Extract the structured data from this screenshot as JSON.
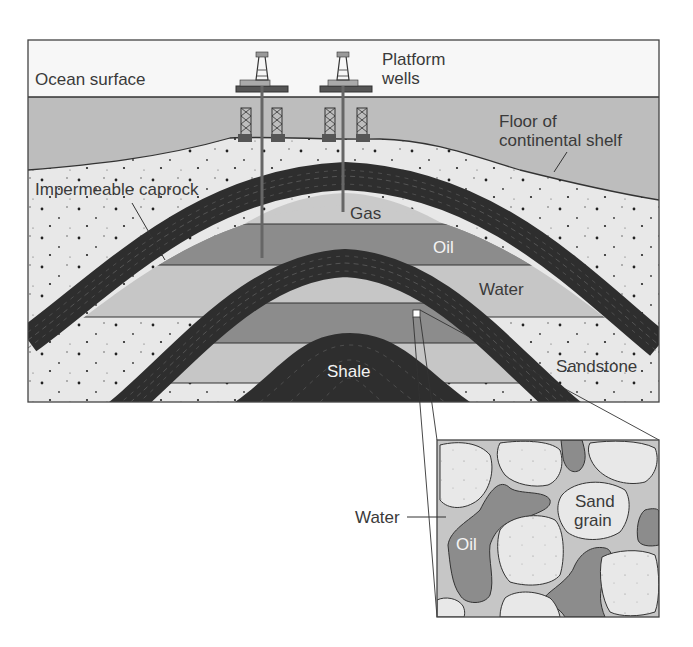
{
  "diagram": {
    "type": "geologic cross-section of offshore oil and gas trap",
    "labels": {
      "ocean_surface": "Ocean surface",
      "platform_wells_line1": "Platform",
      "platform_wells_line2": "wells",
      "floor_line1": "Floor of",
      "floor_line2": "continental shelf",
      "caprock": "Impermeable caprock",
      "gas": "Gas",
      "oil": "Oil",
      "water": "Water",
      "sandstone": "Sandstone",
      "shale": "Shale"
    },
    "inset": {
      "water": "Water",
      "oil": "Oil",
      "sand_grain_line1": "Sand",
      "sand_grain_line2": "grain"
    },
    "colors": {
      "sky": "#f7f7f7",
      "ocean": "#bdbdbd",
      "sediment": "#e8e8e8",
      "caprock": "#2e2e2e",
      "gas": "#c9c9c9",
      "oil": "#8a8a8a",
      "water": "#c6c6c6",
      "outline": "#333333"
    }
  }
}
